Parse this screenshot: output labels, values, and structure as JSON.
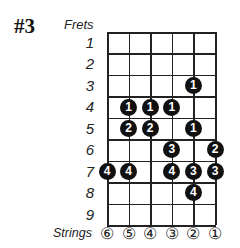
{
  "diagram": {
    "title": "#3",
    "frets_label": "Frets",
    "strings_label": "Strings",
    "fret_numbers": [
      "1",
      "2",
      "3",
      "4",
      "5",
      "6",
      "7",
      "8",
      "9"
    ],
    "string_numbers": [
      "⑥",
      "⑤",
      "④",
      "③",
      "②",
      "①"
    ],
    "notes": [
      {
        "fret": 3,
        "string": 2,
        "finger": "1"
      },
      {
        "fret": 4,
        "string": 5,
        "finger": "1"
      },
      {
        "fret": 4,
        "string": 4,
        "finger": "1"
      },
      {
        "fret": 4,
        "string": 3,
        "finger": "1"
      },
      {
        "fret": 5,
        "string": 5,
        "finger": "2"
      },
      {
        "fret": 5,
        "string": 4,
        "finger": "2"
      },
      {
        "fret": 5,
        "string": 2,
        "finger": "1"
      },
      {
        "fret": 6,
        "string": 3,
        "finger": "3"
      },
      {
        "fret": 6,
        "string": 1,
        "finger": "2"
      },
      {
        "fret": 7,
        "string": 6,
        "finger": "4"
      },
      {
        "fret": 7,
        "string": 5,
        "finger": "4"
      },
      {
        "fret": 7,
        "string": 3,
        "finger": "4"
      },
      {
        "fret": 7,
        "string": 2,
        "finger": "3"
      },
      {
        "fret": 7,
        "string": 1,
        "finger": "3"
      },
      {
        "fret": 8,
        "string": 2,
        "finger": "4"
      }
    ]
  }
}
